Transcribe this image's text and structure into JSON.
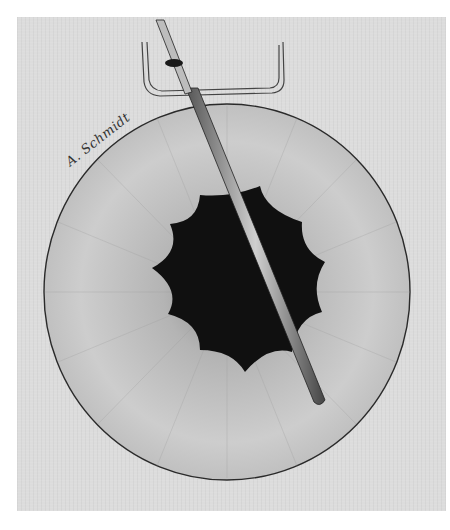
{
  "illustration": {
    "subject": "eye-pupil-with-instrument",
    "signature": "A. Schmidt",
    "colors": {
      "panel": "#dcdcdc",
      "iris": "#cfcfcf",
      "pupil": "#111111",
      "outline": "#333333"
    }
  }
}
